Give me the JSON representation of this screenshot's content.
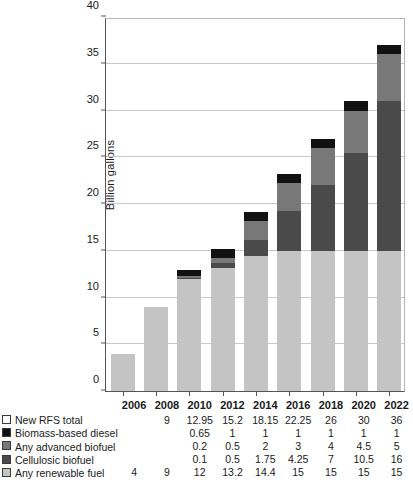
{
  "chart_data": {
    "type": "bar",
    "subtype": "stacked-bar",
    "title": "",
    "xlabel": "",
    "ylabel": "Billion gallons",
    "ylim": [
      0,
      40
    ],
    "ytick_step": 5,
    "yticks": [
      0,
      5,
      10,
      15,
      20,
      25,
      30,
      35,
      40
    ],
    "grid": true,
    "legend_position": "below-left",
    "categories": [
      "2006",
      "2008",
      "2010",
      "2012",
      "2014",
      "2016",
      "2018",
      "2020",
      "2022"
    ],
    "stack_order_bottom_to_top": [
      "Any renewable fuel",
      "Cellulosic biofuel",
      "Any advanced biofuel",
      "Biomass-based diesel"
    ],
    "series": [
      {
        "name": "New RFS total",
        "swatch_color": "#ffffff",
        "is_total_row": true,
        "values": [
          null,
          9,
          12.95,
          15.2,
          18.15,
          22.25,
          26,
          30,
          36
        ],
        "labels": [
          "",
          "9",
          "12.95",
          "15.2",
          "18.15",
          "22.25",
          "26",
          "30",
          "36"
        ]
      },
      {
        "name": "Biomass-based diesel",
        "swatch_color": "#111111",
        "values": [
          null,
          null,
          0.65,
          1,
          1,
          1,
          1,
          1,
          1
        ],
        "labels": [
          "",
          "",
          "0.65",
          "1",
          "1",
          "1",
          "1",
          "1",
          "1"
        ]
      },
      {
        "name": "Any advanced biofuel",
        "swatch_color": "#787878",
        "values": [
          null,
          null,
          0.2,
          0.5,
          2,
          3,
          4,
          4.5,
          5
        ],
        "labels": [
          "",
          "",
          "0.2",
          "0.5",
          "2",
          "3",
          "4",
          "4.5",
          "5"
        ]
      },
      {
        "name": "Cellulosic biofuel",
        "swatch_color": "#4a4a4a",
        "values": [
          null,
          null,
          0.1,
          0.5,
          1.75,
          4.25,
          7,
          10.5,
          16
        ],
        "labels": [
          "",
          "",
          "0.1",
          "0.5",
          "1.75",
          "4.25",
          "7",
          "10.5",
          "16"
        ]
      },
      {
        "name": "Any renewable fuel",
        "swatch_color": "#c4c4c4",
        "values": [
          4,
          9,
          12,
          13.2,
          14.4,
          15,
          15,
          15,
          15
        ],
        "labels": [
          "4",
          "9",
          "12",
          "13.2",
          "14.4",
          "15",
          "15",
          "15",
          "15"
        ]
      }
    ],
    "bar_totals_drawn": [
      9,
      12,
      14.05,
      16.3,
      19.6,
      23.25,
      27,
      31,
      37
    ]
  },
  "axis": {
    "y_title": "Billion gallons",
    "y_tick_labels": [
      "0",
      "5",
      "10",
      "15",
      "20",
      "25",
      "30",
      "35",
      "40"
    ]
  },
  "table": {
    "year_headers": [
      "2006",
      "2008",
      "2010",
      "2012",
      "2014",
      "2016",
      "2018",
      "2020",
      "2022"
    ],
    "rows": [
      {
        "label": "New RFS total",
        "swatch": "#ffffff",
        "values": [
          "",
          "9",
          "12.95",
          "15.2",
          "18.15",
          "22.25",
          "26",
          "30",
          "36"
        ]
      },
      {
        "label": "Biomass-based diesel",
        "swatch": "#111111",
        "values": [
          "",
          "",
          "0.65",
          "1",
          "1",
          "1",
          "1",
          "1",
          "1"
        ]
      },
      {
        "label": "Any advanced biofuel",
        "swatch": "#787878",
        "values": [
          "",
          "",
          "0.2",
          "0.5",
          "2",
          "3",
          "4",
          "4.5",
          "5"
        ]
      },
      {
        "label": "Cellulosic biofuel",
        "swatch": "#4a4a4a",
        "values": [
          "",
          "",
          "0.1",
          "0.5",
          "1.75",
          "4.25",
          "7",
          "10.5",
          "16"
        ]
      },
      {
        "label": "Any renewable fuel",
        "swatch": "#c4c4c4",
        "values": [
          "4",
          "9",
          "12",
          "13.2",
          "14.4",
          "15",
          "15",
          "15",
          "15"
        ]
      }
    ]
  },
  "colors": {
    "renewable_fuel": "#c4c4c4",
    "cellulosic_biofuel": "#4a4a4a",
    "advanced_biofuel": "#787878",
    "biomass_diesel": "#111111",
    "grid": "#c8c8c8",
    "axis": "#555555",
    "text": "#1a1a1a",
    "background": "#ffffff"
  }
}
